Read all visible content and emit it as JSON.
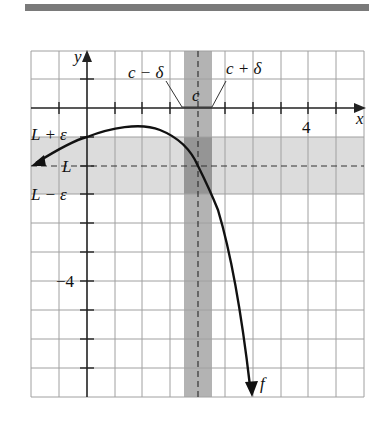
{
  "diagram": {
    "axes": {
      "x_label": "x",
      "y_label": "y",
      "x_tick_label": "4",
      "y_tick_label": "−4"
    },
    "labels": {
      "c": "c",
      "c_minus_delta": "c − δ",
      "c_plus_delta": "c + δ",
      "L": "L",
      "L_plus_eps": "L + ε",
      "L_minus_eps": "L − ε",
      "f": "f"
    },
    "colors": {
      "grid": "#9a9a9a",
      "axis": "#222222",
      "horizontal_band": "#d9d9d9",
      "vertical_band": "#a9a9a9",
      "overlap": "#8f8f8f",
      "curve": "#111111",
      "banner": "#7a7a7a"
    }
  }
}
